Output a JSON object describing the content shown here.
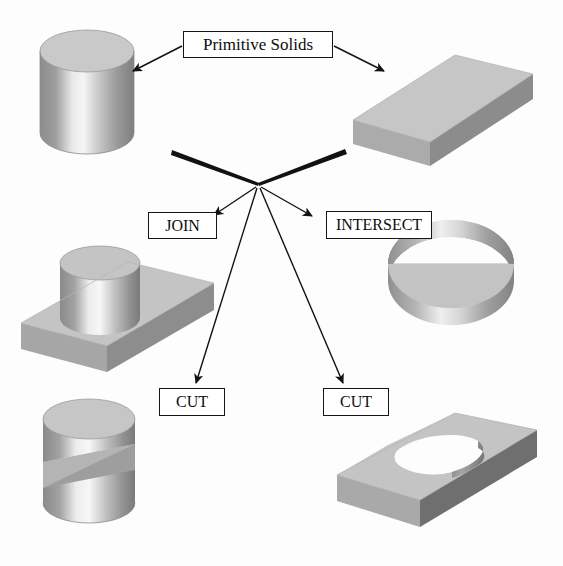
{
  "diagram": {
    "title": "Primitive Solids",
    "background_color": "#fdfdfd",
    "line_color": "#121212"
  },
  "labels": {
    "title": "Primitive Solids",
    "join": "JOIN",
    "intersect": "INTERSECT",
    "cut_left": "CUT",
    "cut_right": "CUT"
  },
  "solids": {
    "primitive_cylinder": {
      "name": "cylinder",
      "role": "primitive",
      "top_face_color": "#c9c9c9",
      "body_light": "#f2f2f2",
      "body_dark": "#8e8e8e"
    },
    "primitive_box": {
      "name": "rectangular-block",
      "role": "primitive",
      "top_face_color": "#c6c6c6",
      "front_face_color": "#a8a8a8",
      "side_face_color": "#8a8a8a"
    },
    "join_result": {
      "name": "cylinder-union-block",
      "role": "join-result",
      "operation": "JOIN"
    },
    "intersect_result": {
      "name": "half-disc-wedge",
      "role": "intersect-result",
      "operation": "INTERSECT"
    },
    "cut_left_result": {
      "name": "cylinder-with-wedge-slot",
      "role": "cut-result",
      "operation": "CUT"
    },
    "cut_right_result": {
      "name": "block-with-circular-notch",
      "role": "cut-result",
      "operation": "CUT"
    }
  },
  "connectors": {
    "hub_x": 258,
    "hub_y": 184,
    "from_title": [
      {
        "to": "primitive_cylinder",
        "style": "thin-arrow"
      },
      {
        "to": "primitive_box",
        "style": "thin-arrow"
      }
    ],
    "inputs": [
      {
        "from": "primitive_cylinder",
        "style": "thick-taper"
      },
      {
        "from": "primitive_box",
        "style": "thick-taper"
      }
    ],
    "outputs": [
      {
        "to": "join",
        "style": "thin-arrow"
      },
      {
        "to": "cut_left",
        "style": "thin-arrow"
      },
      {
        "to": "cut_right",
        "style": "thin-arrow"
      },
      {
        "to": "intersect",
        "style": "thin-arrow"
      }
    ]
  }
}
